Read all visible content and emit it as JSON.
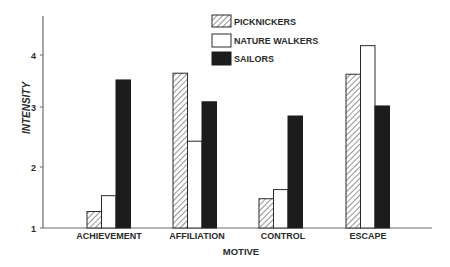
{
  "chart_data": {
    "type": "bar",
    "title": "",
    "xlabel": "MOTIVE",
    "ylabel": "INTENSITY",
    "ylim": [
      1,
      4.3
    ],
    "yticks": [
      1,
      2,
      3,
      4
    ],
    "grid": false,
    "legend_position": "top-right",
    "categories": [
      "ACHIEVEMENT",
      "AFFILIATION",
      "CONTROL",
      "ESCAPE"
    ],
    "series": [
      {
        "name": "PICKNICKERS",
        "pattern": "hatched",
        "values": [
          1.27,
          3.65,
          1.48,
          3.63
        ]
      },
      {
        "name": "NATURE WALKERS",
        "pattern": "white",
        "values": [
          1.53,
          2.43,
          1.63,
          4.18
        ]
      },
      {
        "name": "SAILORS",
        "pattern": "solid-black",
        "values": [
          3.52,
          3.1,
          2.85,
          3.02
        ]
      }
    ]
  },
  "colors": {
    "axis": "#6a6a6a",
    "bar_outline": "#2a2a2a",
    "solid": "#1c1c1c",
    "white": "#ffffff"
  }
}
